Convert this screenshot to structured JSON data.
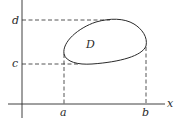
{
  "diagram": {
    "type": "region-in-plane",
    "axes": {
      "x_label": "x"
    },
    "region": {
      "label": "D"
    },
    "x_bounds": {
      "lower": "a",
      "upper": "b"
    },
    "y_bounds": {
      "lower": "c",
      "upper": "d"
    },
    "colors": {
      "stroke": "#2a2a2a",
      "background": "#ffffff"
    }
  }
}
